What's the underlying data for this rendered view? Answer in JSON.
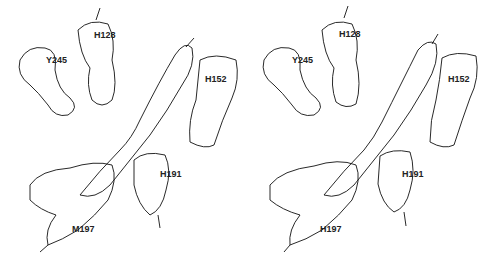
{
  "figure": {
    "type": "stereo electron density map",
    "panels": [
      {
        "id": "left",
        "labels": [
          {
            "text": "Y245",
            "x": 46,
            "y": 56
          },
          {
            "text": "H128",
            "x": 94,
            "y": 31
          },
          {
            "text": "H152",
            "x": 205,
            "y": 75
          },
          {
            "text": "H191",
            "x": 160,
            "y": 170
          },
          {
            "text": "M197",
            "x": 72,
            "y": 225
          }
        ]
      },
      {
        "id": "right",
        "labels": [
          {
            "text": "Y245",
            "x": 48,
            "y": 56
          },
          {
            "text": "H128",
            "x": 95,
            "y": 30
          },
          {
            "text": "H152",
            "x": 204,
            "y": 75
          },
          {
            "text": "H191",
            "x": 158,
            "y": 170
          },
          {
            "text": "H197",
            "x": 76,
            "y": 225
          }
        ]
      }
    ],
    "colors": {
      "mesh": "#1e1e1e",
      "background": "#ffffff"
    }
  }
}
